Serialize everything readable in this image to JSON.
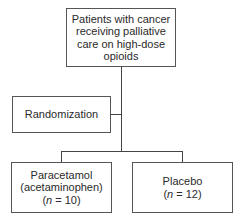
{
  "diagram": {
    "type": "flowchart",
    "nodes": {
      "population": {
        "lines": [
          "Patients with cancer",
          "receiving palliative",
          "care on high-dose",
          "opioids"
        ]
      },
      "randomization": {
        "label": "Randomization"
      },
      "arm_paracetamol": {
        "line1": "Paracetamol",
        "line2": "(acetaminophen)",
        "n_var": "n",
        "n_value": " = 10)"
      },
      "arm_placebo": {
        "line1": "Placebo",
        "n_var": "n",
        "n_value": " = 12)"
      }
    },
    "edges": [
      {
        "from": "population",
        "to": "randomization"
      },
      {
        "from": "randomization",
        "to": "arm_paracetamol"
      },
      {
        "from": "randomization",
        "to": "arm_placebo"
      }
    ]
  }
}
